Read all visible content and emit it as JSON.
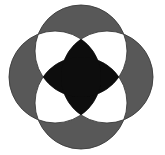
{
  "figure": {
    "type": "venn-rosette",
    "canvas": {
      "width": 165,
      "height": 155
    },
    "background_color": "#ffffff",
    "colors": {
      "background": "#ffffff",
      "single_overlap": "#585858",
      "double_overlap": "#ffffff",
      "triple_overlap": "#0d0d0d",
      "outline": "#3a3a3a"
    },
    "legend": {
      "one_circle": "gray",
      "two_circles": "white",
      "three_or_more_circles": "black"
    },
    "geometry": {
      "center_x": 81,
      "center_y": 77,
      "radius": 46,
      "offset": 26,
      "outline_width": 0.9
    },
    "circles": [
      {
        "name": "circle-north",
        "cx": 81,
        "cy": 51,
        "r": 46
      },
      {
        "name": "circle-east",
        "cx": 107,
        "cy": 77,
        "r": 46
      },
      {
        "name": "circle-south",
        "cx": 81,
        "cy": 103,
        "r": 46
      },
      {
        "name": "circle-west",
        "cx": 55,
        "cy": 77,
        "r": 46
      }
    ]
  }
}
